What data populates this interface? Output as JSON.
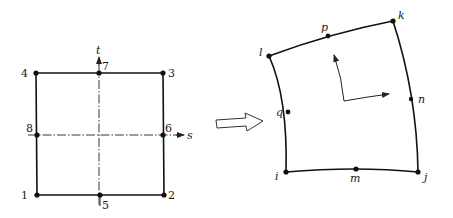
{
  "diagram": {
    "parent_element": {
      "axis_labels": {
        "s": "s",
        "t": "t"
      },
      "nodes": [
        {
          "id": "1",
          "label": "1",
          "x": 37,
          "y": 195
        },
        {
          "id": "2",
          "label": "2",
          "x": 164,
          "y": 195
        },
        {
          "id": "3",
          "label": "3",
          "x": 163,
          "y": 73
        },
        {
          "id": "4",
          "label": "4",
          "x": 36,
          "y": 73
        },
        {
          "id": "5",
          "label": "5",
          "x": 100,
          "y": 195
        },
        {
          "id": "6",
          "label": "6",
          "x": 163,
          "y": 135
        },
        {
          "id": "7",
          "label": "7",
          "x": 99,
          "y": 73
        },
        {
          "id": "8",
          "label": "8",
          "x": 37,
          "y": 135
        }
      ]
    },
    "mapping_arrow": {
      "label": "maps to",
      "style": "hollow-block-arrow"
    },
    "mapped_element": {
      "nodes": [
        {
          "id": "i",
          "label": "i",
          "x": 286,
          "y": 172
        },
        {
          "id": "j",
          "label": "j",
          "x": 418,
          "y": 172
        },
        {
          "id": "k",
          "label": "k",
          "x": 393,
          "y": 21
        },
        {
          "id": "l",
          "label": "l",
          "x": 269,
          "y": 56
        },
        {
          "id": "m",
          "label": "m",
          "x": 356,
          "y": 169
        },
        {
          "id": "n",
          "label": "n",
          "x": 411,
          "y": 99
        },
        {
          "id": "p",
          "label": "p",
          "x": 328,
          "y": 36
        },
        {
          "id": "q",
          "label": "q",
          "x": 288,
          "y": 112
        }
      ],
      "local_axes": "curvilinear-local-axes"
    }
  }
}
